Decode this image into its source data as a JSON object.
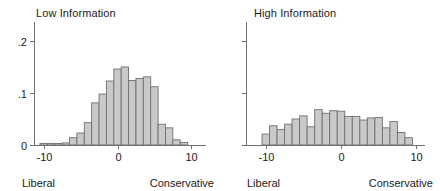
{
  "figure": {
    "background_color": "#ffffff",
    "bar_fill_color": "#c9c9c9",
    "bar_edge_color": "#707070",
    "axis_color": "#6f6f6f",
    "text_color": "#1a1a1a"
  },
  "panels": [
    {
      "id": "low-information",
      "title": "Low Information",
      "xlabel_left": "Liberal",
      "xlabel_right": "Conservative",
      "y_tick_labels": [
        "0",
        ".1",
        ".2"
      ],
      "x_tick_labels": [
        "-10",
        "0",
        "10"
      ]
    },
    {
      "id": "high-information",
      "title": "High Information",
      "xlabel_left": "Liberal",
      "xlabel_right": "Conservative",
      "y_tick_labels": [
        "",
        "",
        ""
      ],
      "x_tick_labels": [
        "-10",
        "0",
        "10"
      ]
    }
  ],
  "chart_data": [
    {
      "type": "bar",
      "id": "low-information",
      "title": "Low Information",
      "subtitle": "",
      "xlabel": "",
      "ylabel": "",
      "xlabel_left_annotation": "Liberal",
      "xlabel_right_annotation": "Conservative",
      "xlim": [
        -10.5,
        10.5
      ],
      "ylim": [
        0,
        0.225
      ],
      "xticks": [
        -10,
        0,
        10
      ],
      "xticklabels": [
        "-10",
        "0",
        "10"
      ],
      "yticks": [
        0,
        0.1,
        0.2
      ],
      "yticklabels": [
        "0",
        ".1",
        ".2"
      ],
      "grid": false,
      "legend": false,
      "bin_width": 1,
      "categories": [
        -10,
        -9,
        -8,
        -7,
        -6,
        -5,
        -4,
        -3,
        -2,
        -1,
        0,
        1,
        2,
        3,
        4,
        5,
        6,
        7,
        8,
        9
      ],
      "values": [
        0.003,
        0.003,
        0.003,
        0.004,
        0.014,
        0.023,
        0.043,
        0.081,
        0.098,
        0.123,
        0.146,
        0.15,
        0.124,
        0.128,
        0.131,
        0.112,
        0.04,
        0.033,
        0.01,
        0.005
      ]
    },
    {
      "type": "bar",
      "id": "high-information",
      "title": "High Information",
      "subtitle": "",
      "xlabel": "",
      "ylabel": "",
      "xlabel_left_annotation": "Liberal",
      "xlabel_right_annotation": "Conservative",
      "xlim": [
        -10.5,
        10.5
      ],
      "ylim": [
        0,
        0.225
      ],
      "xticks": [
        -10,
        0,
        10
      ],
      "xticklabels": [
        "-10",
        "0",
        "10"
      ],
      "yticks": [
        0,
        0.1,
        0.2
      ],
      "yticklabels": [
        "",
        "",
        ""
      ],
      "grid": false,
      "legend": false,
      "bin_width": 1,
      "categories": [
        -10,
        -9,
        -8,
        -7,
        -6,
        -5,
        -4,
        -3,
        -2,
        -1,
        0,
        1,
        2,
        3,
        4,
        5,
        6,
        7,
        8,
        9
      ],
      "values": [
        0.021,
        0.037,
        0.03,
        0.04,
        0.05,
        0.056,
        0.035,
        0.068,
        0.061,
        0.066,
        0.065,
        0.055,
        0.055,
        0.048,
        0.052,
        0.053,
        0.033,
        0.045,
        0.024,
        0.014
      ]
    }
  ]
}
